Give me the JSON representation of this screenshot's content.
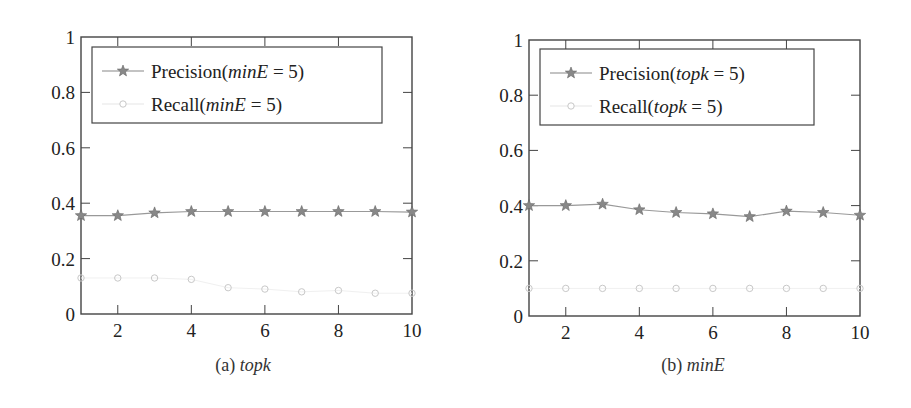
{
  "chart_data": [
    {
      "type": "line",
      "panel": "a",
      "caption_prefix": "(a)",
      "caption_var": "topk",
      "xlabel": "topk",
      "ylabel": "",
      "xlim": [
        1,
        10
      ],
      "ylim": [
        0,
        1
      ],
      "xticks": [
        2,
        4,
        6,
        8,
        10
      ],
      "yticks": [
        0,
        0.2,
        0.4,
        0.6,
        0.8,
        1
      ],
      "ytick_labels": [
        "0",
        "0.2",
        "0.4",
        "0.6",
        "0.8",
        "1"
      ],
      "grid": false,
      "legend_position": "upper left",
      "x": [
        1,
        2,
        3,
        4,
        5,
        6,
        7,
        8,
        9,
        10
      ],
      "series": [
        {
          "name": "Precision(minE = 5)",
          "label_main": "Precision(",
          "label_var": "minE",
          "label_rest": " = 5)",
          "marker": "star",
          "values": [
            0.355,
            0.355,
            0.365,
            0.37,
            0.37,
            0.37,
            0.37,
            0.37,
            0.37,
            0.368
          ]
        },
        {
          "name": "Recall(minE = 5)",
          "label_main": "Recall(",
          "label_var": "minE",
          "label_rest": " = 5)",
          "marker": "circle",
          "values": [
            0.13,
            0.13,
            0.13,
            0.125,
            0.095,
            0.09,
            0.08,
            0.085,
            0.075,
            0.075
          ]
        }
      ]
    },
    {
      "type": "line",
      "panel": "b",
      "caption_prefix": "(b)",
      "caption_var": "minE",
      "xlabel": "minE",
      "ylabel": "",
      "xlim": [
        1,
        10
      ],
      "ylim": [
        0,
        1
      ],
      "xticks": [
        2,
        4,
        6,
        8,
        10
      ],
      "yticks": [
        0,
        0.2,
        0.4,
        0.6,
        0.8,
        1
      ],
      "ytick_labels": [
        "0",
        "0.2",
        "0.4",
        "0.6",
        "0.8",
        "1"
      ],
      "grid": false,
      "legend_position": "upper left",
      "x": [
        1,
        2,
        3,
        4,
        5,
        6,
        7,
        8,
        9,
        10
      ],
      "series": [
        {
          "name": "Precision(topk = 5)",
          "label_main": "Precision(",
          "label_var": "topk",
          "label_rest": " = 5)",
          "marker": "star",
          "values": [
            0.4,
            0.4,
            0.405,
            0.385,
            0.375,
            0.37,
            0.36,
            0.38,
            0.375,
            0.365
          ]
        },
        {
          "name": "Recall(topk = 5)",
          "label_main": "Recall(",
          "label_var": "topk",
          "label_rest": " = 5)",
          "marker": "circle",
          "values": [
            0.1,
            0.1,
            0.1,
            0.1,
            0.1,
            0.1,
            0.1,
            0.1,
            0.1,
            0.1
          ]
        }
      ]
    }
  ],
  "colors": {
    "axis": "#444444",
    "precision": "#777777",
    "recall": "#c8c8c8",
    "text": "#222222"
  }
}
